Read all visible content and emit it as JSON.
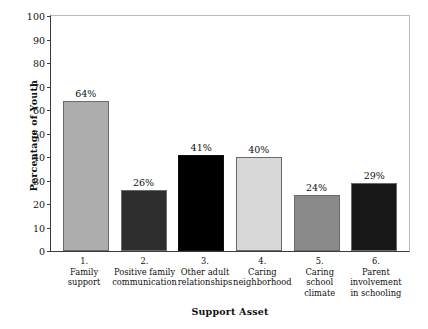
{
  "chart_data": {
    "type": "bar",
    "title": "",
    "xlabel": "Support Asset",
    "ylabel": "Percentage of Youth",
    "ylim": [
      0,
      100
    ],
    "ytick_step": 10,
    "yticks": [
      "100",
      "90",
      "80",
      "70",
      "60",
      "50",
      "40",
      "30",
      "20",
      "10",
      "0"
    ],
    "grid": false,
    "legend": "none",
    "categories": [
      "1.\nFamily\nsupport",
      "2.\nPositive family\ncommunication",
      "3.\nOther adult\nrelationships",
      "4.\nCaring\nneighborhood",
      "5.\nCaring\nschool\nclimate",
      "6.\nParent\ninvolvement\nin schooling"
    ],
    "values": [
      64,
      26,
      41,
      40,
      24,
      29
    ],
    "value_labels": [
      "64%",
      "26%",
      "41%",
      "40%",
      "24%",
      "29%"
    ],
    "bar_colors": [
      "#adadad",
      "#2e2e2e",
      "#000000",
      "#d8d8d8",
      "#8a8a8a",
      "#171717"
    ],
    "bars": [
      {
        "index": "1.",
        "name_lines": [
          "Family",
          "support"
        ],
        "value": 64,
        "value_label": "64%",
        "color": "#adadad"
      },
      {
        "index": "2.",
        "name_lines": [
          "Positive family",
          "communication"
        ],
        "value": 26,
        "value_label": "26%",
        "color": "#2e2e2e"
      },
      {
        "index": "3.",
        "name_lines": [
          "Other adult",
          "relationships"
        ],
        "value": 41,
        "value_label": "41%",
        "color": "#000000"
      },
      {
        "index": "4.",
        "name_lines": [
          "Caring",
          "neighborhood"
        ],
        "value": 40,
        "value_label": "40%",
        "color": "#d8d8d8"
      },
      {
        "index": "5.",
        "name_lines": [
          "Caring",
          "school",
          "climate"
        ],
        "value": 24,
        "value_label": "24%",
        "color": "#8a8a8a"
      },
      {
        "index": "6.",
        "name_lines": [
          "Parent",
          "involvement",
          "in schooling"
        ],
        "value": 29,
        "value_label": "29%",
        "color": "#171717"
      }
    ]
  },
  "axis_color": "#3b3b3b",
  "frame_color": "#b9b9b9",
  "background": "#ffffff"
}
